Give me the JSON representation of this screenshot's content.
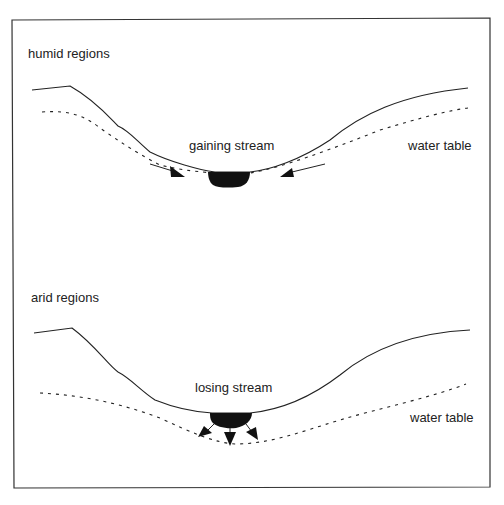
{
  "panels": {
    "humid": {
      "title": "humid regions",
      "stream_label": "gaining stream",
      "water_table_label": "water table"
    },
    "arid": {
      "title": "arid regions",
      "stream_label": "losing stream",
      "water_table_label": "water table"
    }
  },
  "colors": {
    "line": "#222222",
    "border": "#333333",
    "stream": "#111111",
    "background": "#ffffff"
  }
}
